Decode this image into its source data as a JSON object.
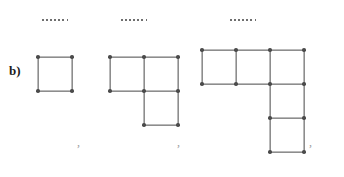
{
  "figure": {
    "part_label": "b)",
    "kind": "matchstick-sequence",
    "separator": ",",
    "dots_glyph": "·",
    "colors": {
      "stick": "#8d8d8d",
      "stick_highlight": "#b9b9b9",
      "head": "#4b4b4b",
      "label": "#1c1c1c",
      "dot": "#6f6f6f",
      "comma": "#9a9a9a",
      "background": "#ffffff"
    },
    "geometry": {
      "cell": 34,
      "stick_thickness": 2.4,
      "head_diameter": 3.6
    },
    "dot_rows": [
      {
        "name": "dots-above-term-1",
        "count": 7,
        "x": 42,
        "y": 19
      },
      {
        "name": "dots-above-term-2",
        "count": 7,
        "x": 121,
        "y": 19
      },
      {
        "name": "dots-above-term-3",
        "count": 7,
        "x": 230,
        "y": 19
      }
    ],
    "terms": [
      {
        "index": 1,
        "name": "term-1",
        "origin": {
          "x": 38,
          "y": 57
        },
        "squares": 1,
        "matchsticks": 4,
        "cells": [
          {
            "col": 0,
            "row": 0
          }
        ],
        "comma": {
          "x": 77,
          "y": 136
        }
      },
      {
        "index": 2,
        "name": "term-2",
        "origin": {
          "x": 110,
          "y": 57
        },
        "squares": 3,
        "matchsticks": 10,
        "cells": [
          {
            "col": 0,
            "row": 0
          },
          {
            "col": 1,
            "row": 0
          },
          {
            "col": 1,
            "row": 1
          }
        ],
        "comma": {
          "x": 177,
          "y": 136
        }
      },
      {
        "index": 3,
        "name": "term-3",
        "origin": {
          "x": 202,
          "y": 50
        },
        "squares": 5,
        "matchsticks": 16,
        "cells": [
          {
            "col": 0,
            "row": 0
          },
          {
            "col": 1,
            "row": 0
          },
          {
            "col": 2,
            "row": 0
          },
          {
            "col": 2,
            "row": 1
          },
          {
            "col": 2,
            "row": 2
          }
        ],
        "comma": {
          "x": 309,
          "y": 136
        }
      }
    ],
    "label_position": {
      "x": 9,
      "y": 64
    }
  }
}
